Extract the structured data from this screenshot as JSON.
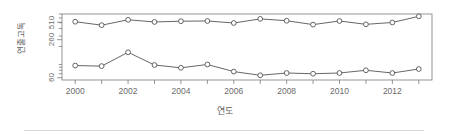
{
  "chart_data": {
    "type": "line",
    "title": "",
    "subtitle": "",
    "xlabel": "연도",
    "ylabel": "연출고독",
    "x": [
      2000,
      2001,
      2002,
      2003,
      2004,
      2005,
      2006,
      2007,
      2008,
      2009,
      2010,
      2011,
      2012,
      2013
    ],
    "xlim": [
      1999.5,
      2013.5
    ],
    "ylim": [
      55,
      700
    ],
    "yscale": "log",
    "ytick_labels": [
      "60",
      "260",
      "510"
    ],
    "ytick_values": [
      60,
      260,
      510
    ],
    "xtick_labels": [
      "2000",
      "2002",
      "2004",
      "2006",
      "2008",
      "2010",
      "2012"
    ],
    "xtick_values": [
      2000,
      2002,
      2004,
      2006,
      2008,
      2010,
      2012
    ],
    "grid": false,
    "legend": "none",
    "marker": "open-circle",
    "line_color": "#555555",
    "marker_face_color": "#ffffff",
    "axis_color": "#7a7a7a",
    "series": [
      {
        "name": "upper",
        "values": [
          520,
          455,
          560,
          515,
          530,
          535,
          495,
          580,
          540,
          465,
          535,
          470,
          505,
          640
        ]
      },
      {
        "name": "lower",
        "values": [
          96,
          94,
          160,
          98,
          88,
          100,
          76,
          66,
          72,
          70,
          72,
          80,
          72,
          84
        ]
      }
    ]
  }
}
